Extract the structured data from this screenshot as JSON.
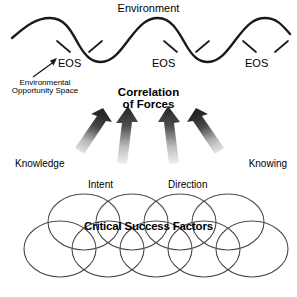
{
  "diagram": {
    "title": "Environment",
    "environment": {
      "label": "Environment",
      "wave_marker_label": "EOS",
      "markers": [
        {
          "id": "eos-1",
          "label": "EOS"
        },
        {
          "id": "eos-2",
          "label": "EOS"
        },
        {
          "id": "eos-3",
          "label": "EOS"
        }
      ],
      "annotation": {
        "line1": "Environmental",
        "line2": "Opportunity Space",
        "text": "Environmental Opportunity Space"
      }
    },
    "correlation": {
      "line1": "Correlation",
      "line2": "of Forces",
      "text": "Correlation of Forces"
    },
    "forces": [
      {
        "id": "force-knowledge",
        "label": "Knowledge"
      },
      {
        "id": "force-intent",
        "label": "Intent"
      },
      {
        "id": "force-direction",
        "label": "Direction"
      },
      {
        "id": "force-knowing",
        "label": "Knowing"
      }
    ],
    "force_labels": {
      "knowledge": "Knowledge",
      "intent": "Intent",
      "direction": "Direction",
      "knowing": "Knowing"
    },
    "critical_success_factors": {
      "label": "Critical Success Factors"
    },
    "colors": {
      "background": "#ffffff",
      "stroke": "#1a1a1a",
      "text": "#000000",
      "circle_stroke": "#555555",
      "arrow_dark": "#2b2b2b",
      "arrow_light": "#e8e8e8"
    }
  }
}
